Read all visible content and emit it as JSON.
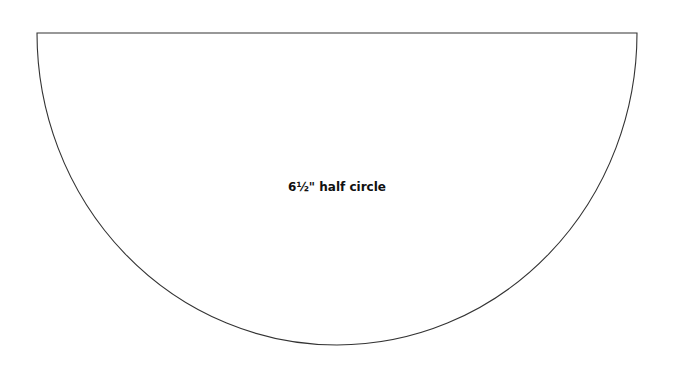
{
  "diagram": {
    "label": "6½\" half circle",
    "stroke_color": "#333333",
    "background": "#ffffff"
  }
}
